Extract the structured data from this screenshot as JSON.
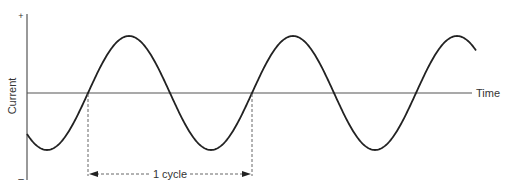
{
  "diagram": {
    "y_axis": {
      "label": "Current",
      "positive_marker": "+",
      "negative_marker": "–"
    },
    "x_axis": {
      "label": "Time"
    },
    "annotation": {
      "label": "1 cycle"
    },
    "colors": {
      "wave": "#222222",
      "axis": "#555555",
      "dashed": "#555555",
      "text": "#333333"
    }
  }
}
